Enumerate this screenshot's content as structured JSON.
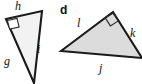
{
  "figure": {
    "type": "geometry-diagram",
    "background_color": "#ffffff",
    "stroke_color": "#1a1a1a",
    "fill_color": "#dcdcdc",
    "fill_color_light": "#f2f2f2",
    "part_label": "d"
  },
  "triangles": [
    {
      "id": "left-triangle",
      "part_letter": "",
      "fill": "#f2f2f2",
      "right_angle_vertex": "top-left",
      "vertices": [
        {
          "name": "top-left",
          "x": 6,
          "y": 19
        },
        {
          "name": "top-right",
          "x": 42,
          "y": 11
        },
        {
          "name": "bottom",
          "x": 34,
          "y": 83
        }
      ],
      "sides": [
        {
          "label": "h",
          "between": "top-left to top-right",
          "label_x": 15,
          "label_y": 0
        },
        {
          "label": "i",
          "between": "top-right to bottom",
          "label_x": 37,
          "label_y": 43
        },
        {
          "label": "g",
          "between": "top-left to bottom",
          "label_x": 4,
          "label_y": 55
        }
      ]
    },
    {
      "id": "right-triangle",
      "part_letter": "d",
      "fill": "#dcdcdc",
      "right_angle_vertex": "apex",
      "vertices": [
        {
          "name": "left",
          "x": 61,
          "y": 51
        },
        {
          "name": "apex",
          "x": 113,
          "y": 12
        },
        {
          "name": "right",
          "x": 142,
          "y": 58
        }
      ],
      "sides": [
        {
          "label": "l",
          "between": "left to apex",
          "label_x": 77,
          "label_y": 17
        },
        {
          "label": "k",
          "between": "apex to right",
          "label_x": 130,
          "label_y": 27
        },
        {
          "label": "j",
          "between": "left to right",
          "label_x": 99,
          "label_y": 62
        }
      ]
    }
  ],
  "labels": {
    "left": {
      "h": "h",
      "i": "i",
      "g": "g"
    },
    "right": {
      "d": "d",
      "l": "l",
      "k": "k",
      "j": "j"
    }
  }
}
